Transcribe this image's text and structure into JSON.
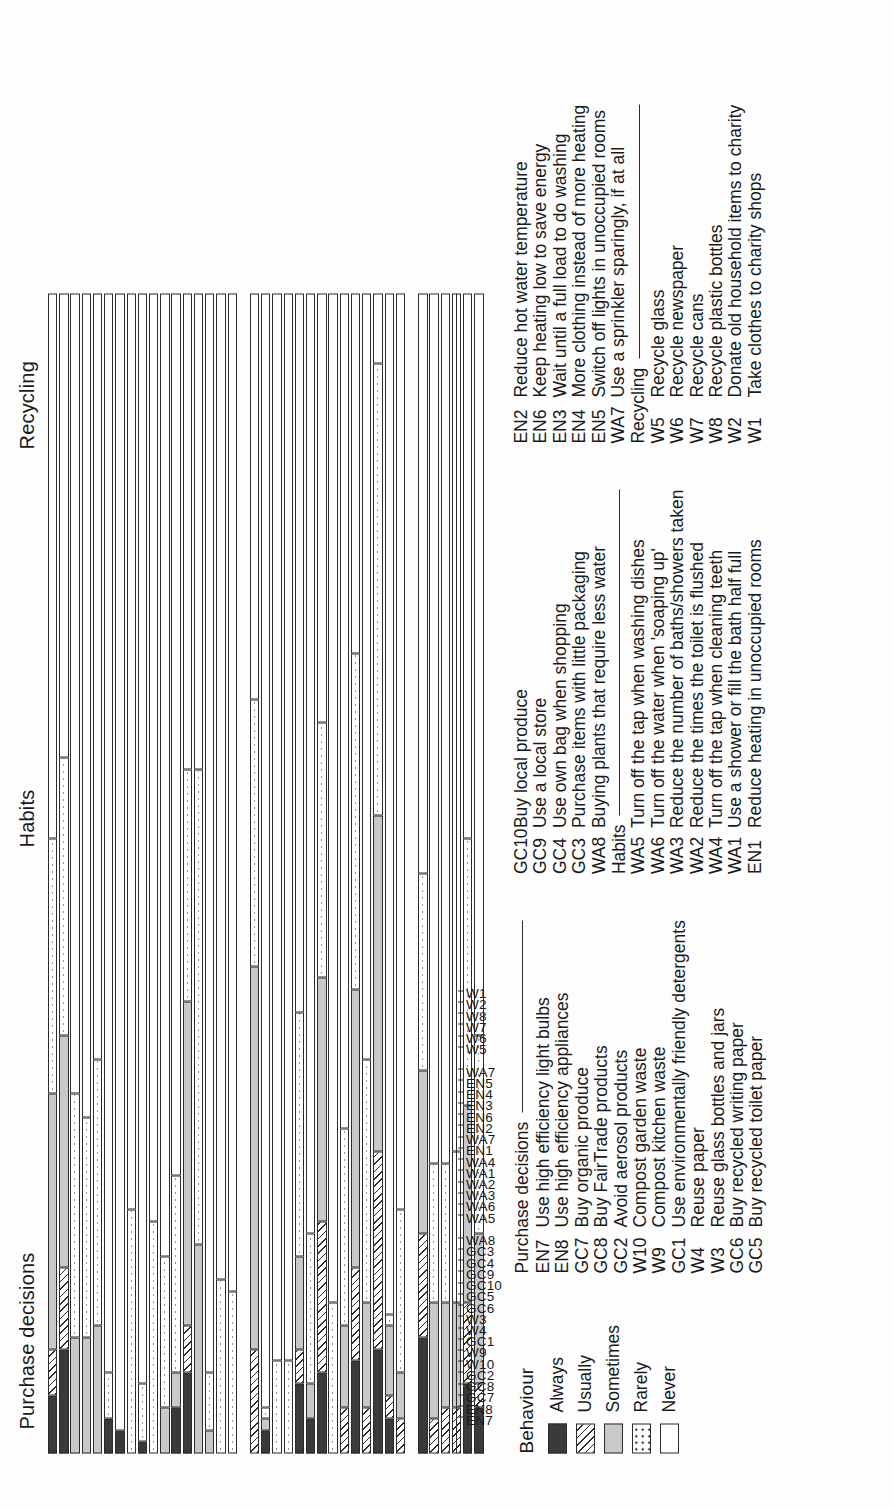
{
  "figure": {
    "orientation": "rotated-90-ccw",
    "group_titles": [
      "Purchase decisions",
      "Habits",
      "Recycling"
    ]
  },
  "legend": {
    "title": "Behaviour",
    "items": [
      {
        "label": "Always",
        "pattern": "solid-dark"
      },
      {
        "label": "Usually",
        "pattern": "diagonal-hatch"
      },
      {
        "label": "Sometimes",
        "pattern": "solid-light-grey"
      },
      {
        "label": "Rarely",
        "pattern": "dotted"
      },
      {
        "label": "Never",
        "pattern": "white"
      }
    ]
  },
  "keys": [
    {
      "header": "Purchase decisions",
      "items": [
        {
          "code": "EN7",
          "text": "Use high efficiency light bulbs"
        },
        {
          "code": "EN8",
          "text": "Use high efficiency appliances"
        },
        {
          "code": "GC7",
          "text": "Buy organic produce"
        },
        {
          "code": "GC8",
          "text": "Buy FairTrade products"
        },
        {
          "code": "GC2",
          "text": "Avoid aerosol products"
        },
        {
          "code": "W10",
          "text": "Compost garden waste"
        },
        {
          "code": "W9",
          "text": "Compost kitchen waste"
        },
        {
          "code": "GC1",
          "text": "Use environmentally friendly detergents"
        },
        {
          "code": "W4",
          "text": "Reuse paper"
        },
        {
          "code": "W3",
          "text": "Reuse glass bottles and jars"
        },
        {
          "code": "GC6",
          "text": "Buy recycled writing paper"
        },
        {
          "code": "GC5",
          "text": "Buy recycled toilet paper"
        }
      ]
    },
    {
      "header": "",
      "items": [
        {
          "code": "GC10",
          "text": "Buy local produce"
        },
        {
          "code": "GC9",
          "text": "Use a local store"
        },
        {
          "code": "GC4",
          "text": "Use own bag when shopping"
        },
        {
          "code": "GC3",
          "text": "Purchase items with little packaging"
        },
        {
          "code": "WA8",
          "text": "Buying plants that require less water"
        }
      ],
      "subheader": "Habits",
      "sub_items": [
        {
          "code": "WA5",
          "text": "Turn off the tap when washing dishes"
        },
        {
          "code": "WA6",
          "text": "Turn off the water when 'soaping up'"
        },
        {
          "code": "WA3",
          "text": "Reduce the number of baths/showers taken"
        },
        {
          "code": "WA2",
          "text": "Reduce the times the toilet is flushed"
        },
        {
          "code": "WA4",
          "text": "Turn off the tap when cleaning teeth"
        },
        {
          "code": "WA1",
          "text": "Use a shower or fill the bath half full"
        },
        {
          "code": "EN1",
          "text": "Reduce heating in unoccupied rooms"
        }
      ]
    },
    {
      "header": "",
      "items": [
        {
          "code": "EN2",
          "text": "Reduce hot water temperature"
        },
        {
          "code": "EN6",
          "text": "Keep heating low to save energy"
        },
        {
          "code": "EN3",
          "text": "Wait until a full load to do washing"
        },
        {
          "code": "EN4",
          "text": "More clothing instead of more heating"
        },
        {
          "code": "EN5",
          "text": "Switch off lights in unoccupied rooms"
        },
        {
          "code": "WA7",
          "text": "Use a sprinkler sparingly, if at all"
        }
      ],
      "subheader": "Recycling",
      "sub_items": [
        {
          "code": "W5",
          "text": "Recycle glass"
        },
        {
          "code": "W6",
          "text": "Recycle newspaper"
        },
        {
          "code": "W7",
          "text": "Recycle cans"
        },
        {
          "code": "W8",
          "text": "Recycle plastic bottles"
        },
        {
          "code": "W2",
          "text": "Donate old household items to charity"
        },
        {
          "code": "W1",
          "text": "Take clothes to charity shops"
        }
      ]
    }
  ],
  "chart_data": {
    "type": "bar",
    "subtype": "stacked-horizontal-100-percent",
    "title": "",
    "xlabel": "",
    "ylabel": "",
    "xlim": [
      0,
      100
    ],
    "grid": false,
    "legend_position": "right",
    "series": [
      {
        "name": "Always",
        "pattern": "solid-dark"
      },
      {
        "name": "Usually",
        "pattern": "diagonal-hatch"
      },
      {
        "name": "Sometimes",
        "pattern": "solid-light-grey"
      },
      {
        "name": "Rarely",
        "pattern": "dotted"
      },
      {
        "name": "Never",
        "pattern": "white"
      }
    ],
    "groups": [
      {
        "name": "Purchase decisions",
        "categories": [
          "EN7",
          "EN8",
          "GC7",
          "GC8",
          "GC2",
          "W10",
          "W9",
          "GC1",
          "W4",
          "W3",
          "GC6",
          "GC5",
          "GC10",
          "GC9",
          "GC4",
          "GC3",
          "WA8"
        ],
        "values": [
          [
            5,
            4,
            22,
            22,
            47
          ],
          [
            9,
            7,
            20,
            24,
            40
          ],
          [
            0,
            0,
            10,
            21,
            69
          ],
          [
            0,
            0,
            10,
            19,
            71
          ],
          [
            0,
            0,
            11,
            23,
            66
          ],
          [
            3,
            0,
            0,
            4,
            93
          ],
          [
            2,
            0,
            0,
            0,
            98
          ],
          [
            0,
            0,
            0,
            21,
            79
          ],
          [
            1,
            0,
            0,
            5,
            94
          ],
          [
            0,
            0,
            0,
            20,
            80
          ],
          [
            0,
            0,
            4,
            13,
            83
          ],
          [
            4,
            0,
            3,
            17,
            76
          ],
          [
            7,
            4,
            28,
            20,
            41
          ],
          [
            0,
            0,
            18,
            41,
            41
          ],
          [
            0,
            0,
            2,
            5,
            93
          ],
          [
            0,
            0,
            0,
            15,
            85
          ],
          [
            0,
            0,
            0,
            14,
            86
          ]
        ]
      },
      {
        "name": "Habits",
        "categories": [
          "WA5",
          "WA6",
          "WA3",
          "WA2",
          "WA1",
          "WA4",
          "EN1",
          "WA7",
          "EN2",
          "EN6",
          "EN3",
          "EN4",
          "EN5",
          "WA7b"
        ],
        "values": [
          [
            0,
            9,
            33,
            23,
            35
          ],
          [
            2,
            0,
            1,
            1,
            96
          ],
          [
            0,
            0,
            0,
            8,
            92
          ],
          [
            0,
            0,
            0,
            8,
            92
          ],
          [
            6,
            3,
            8,
            21,
            62
          ],
          [
            3,
            0,
            3,
            13,
            81
          ],
          [
            7,
            13,
            21,
            22,
            37
          ],
          [
            0,
            0,
            0,
            13,
            87
          ],
          [
            0,
            4,
            7,
            17,
            72
          ],
          [
            8,
            8,
            24,
            29,
            31
          ],
          [
            0,
            4,
            9,
            21,
            66
          ],
          [
            9,
            17,
            29,
            39,
            6
          ],
          [
            3,
            2,
            6,
            1,
            88
          ],
          [
            0,
            3,
            4,
            14,
            79
          ]
        ]
      },
      {
        "name": "Recycling",
        "categories": [
          "W5",
          "W6",
          "W7",
          "W8",
          "W2",
          "W1"
        ],
        "values": [
          [
            10,
            9,
            14,
            17,
            50
          ],
          [
            0,
            3,
            10,
            12,
            75
          ],
          [
            0,
            4,
            9,
            12,
            75
          ],
          [
            0,
            4,
            9,
            13,
            74
          ],
          [
            6,
            7,
            17,
            23,
            47
          ],
          [
            4,
            2,
            13,
            17,
            64
          ]
        ]
      }
    ]
  }
}
